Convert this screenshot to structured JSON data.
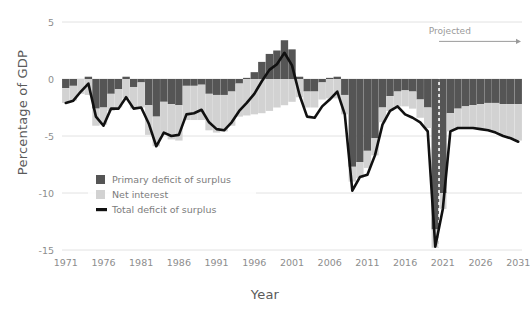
{
  "chart_data": {
    "type": "bar",
    "title": "",
    "subtitle": "",
    "xlabel": "Year",
    "ylabel": "Percentage of GDP",
    "xlim": [
      1970.5,
      2031.5
    ],
    "ylim": [
      -15,
      5
    ],
    "grid": true,
    "grid_axis": "y",
    "legend_position": "lower-left",
    "xticks": [
      1971,
      1976,
      1981,
      1986,
      1991,
      1996,
      2001,
      2006,
      2011,
      2016,
      2021,
      2026,
      2031
    ],
    "yticks": [
      5,
      0,
      -5,
      -10,
      -15
    ],
    "ytick_labels": [
      "5",
      "0",
      "-5",
      "-10",
      "-15"
    ],
    "xtick_labels": [
      "1971",
      "1976",
      "1981",
      "1986",
      "1991",
      "1996",
      "2001",
      "2006",
      "2011",
      "2016",
      "2021",
      "2026",
      "2031"
    ],
    "stacked": true,
    "annotations": [
      {
        "name": "projected-label",
        "text": "Projected",
        "x": 2021.0,
        "y": 4.2,
        "arrow_from_x": 2020.5,
        "arrow_to_x": 2031.5,
        "arrow_y": 3.3
      },
      {
        "name": "projection-divider",
        "text": "",
        "style": "dashed-vertical",
        "x": 2020.5
      }
    ],
    "legend": [
      {
        "label": "Primary deficit of surplus",
        "color": "#555555",
        "marker": "square"
      },
      {
        "label": "Net interest",
        "color": "#d2d2d2",
        "marker": "square"
      },
      {
        "label": "Total deficit of surplus",
        "color": "#111111",
        "marker": "line"
      }
    ],
    "x": [
      1971,
      1972,
      1973,
      1974,
      1975,
      1976,
      1977,
      1978,
      1979,
      1980,
      1981,
      1982,
      1983,
      1984,
      1985,
      1986,
      1987,
      1988,
      1989,
      1990,
      1991,
      1992,
      1993,
      1994,
      1995,
      1996,
      1997,
      1998,
      1999,
      2000,
      2001,
      2002,
      2003,
      2004,
      2005,
      2006,
      2007,
      2008,
      2009,
      2010,
      2011,
      2012,
      2013,
      2014,
      2015,
      2016,
      2017,
      2018,
      2019,
      2020,
      2021,
      2022,
      2023,
      2024,
      2025,
      2026,
      2027,
      2028,
      2029,
      2030,
      2031
    ],
    "series": [
      {
        "name": "Primary deficit of surplus",
        "color": "#555555",
        "values": [
          -0.8,
          -0.6,
          0.0,
          0.2,
          -2.6,
          -2.5,
          -1.3,
          -0.9,
          0.2,
          -0.7,
          -0.3,
          -2.3,
          -3.3,
          -2.0,
          -2.2,
          -2.3,
          -0.6,
          -0.6,
          -0.5,
          -1.3,
          -1.4,
          -1.4,
          -1.1,
          -0.4,
          0.1,
          0.6,
          1.5,
          2.2,
          2.5,
          3.4,
          2.6,
          0.2,
          -1.1,
          -1.1,
          -0.3,
          0.1,
          0.2,
          -1.4,
          -7.7,
          -7.3,
          -6.3,
          -5.2,
          -2.5,
          -1.5,
          -1.1,
          -1.0,
          -1.1,
          -1.8,
          -2.5,
          -13.2,
          -10.0,
          -3.0,
          -2.6,
          -2.4,
          -2.3,
          -2.2,
          -2.1,
          -2.1,
          -2.2,
          -2.2,
          -2.2
        ]
      },
      {
        "name": "Net interest",
        "color": "#d2d2d2",
        "values": [
          -1.3,
          -1.3,
          -1.3,
          -1.4,
          -1.5,
          -1.5,
          -1.5,
          -1.6,
          -1.7,
          -1.9,
          -2.2,
          -2.6,
          -2.6,
          -2.9,
          -3.1,
          -3.1,
          -3.0,
          -3.0,
          -3.1,
          -3.2,
          -3.3,
          -3.2,
          -3.0,
          -2.9,
          -3.2,
          -3.1,
          -3.0,
          -2.8,
          -2.5,
          -2.3,
          -2.0,
          -1.6,
          -1.4,
          -1.4,
          -1.5,
          -1.7,
          -1.7,
          -1.7,
          -1.3,
          -1.4,
          -1.5,
          -1.5,
          -1.3,
          -1.3,
          -1.3,
          -1.4,
          -1.5,
          -1.6,
          -1.8,
          -1.6,
          -1.4,
          -1.6,
          -1.7,
          -1.9,
          -2.0,
          -2.2,
          -2.4,
          -2.6,
          -2.8,
          -3.0,
          -3.2
        ]
      }
    ],
    "total_line": {
      "name": "Total deficit of surplus",
      "color": "#111111",
      "values": [
        -2.1,
        -1.9,
        -1.1,
        -0.4,
        -3.3,
        -4.1,
        -2.6,
        -2.6,
        -1.6,
        -2.6,
        -2.5,
        -3.9,
        -5.9,
        -4.7,
        -5.0,
        -4.9,
        -3.1,
        -3.0,
        -2.7,
        -3.8,
        -4.4,
        -4.5,
        -3.8,
        -2.8,
        -2.1,
        -1.3,
        -0.2,
        0.8,
        1.3,
        2.3,
        1.2,
        -1.4,
        -3.3,
        -3.4,
        -2.4,
        -1.8,
        -1.1,
        -3.1,
        -9.8,
        -8.6,
        -8.4,
        -6.7,
        -4.0,
        -2.8,
        -2.4,
        -3.1,
        -3.4,
        -3.8,
        -4.6,
        -14.7,
        -11.4,
        -4.6,
        -4.3,
        -4.3,
        -4.3,
        -4.4,
        -4.5,
        -4.7,
        -5.0,
        -5.2,
        -5.5
      ]
    }
  }
}
